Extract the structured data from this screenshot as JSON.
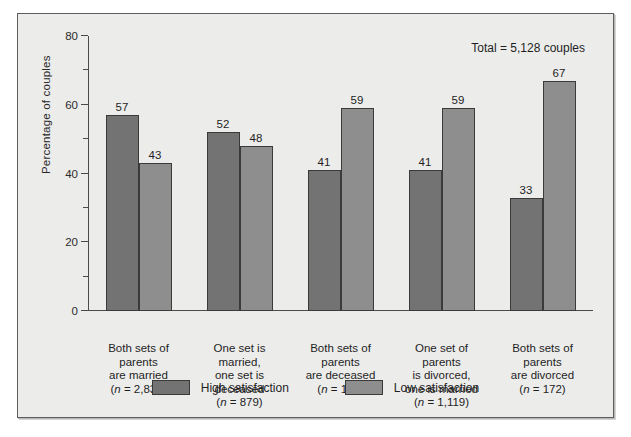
{
  "chart_data": {
    "type": "bar",
    "title": "",
    "xlabel": "",
    "ylabel": "Percentage of couples",
    "ylim": [
      0,
      80
    ],
    "yticks": [
      0,
      20,
      40,
      60,
      80
    ],
    "ytick_labels": [
      "0",
      "20",
      "40",
      "60",
      "80"
    ],
    "minor_ytick_step": 10,
    "grid": false,
    "legend_position": "bottom-center",
    "annotation": "Total = 5,128 couples",
    "categories": [
      "Both sets of parents are married (n = 2,831)",
      "One set is married, one set is deceased (n = 879)",
      "Both sets of parents are deceased (n = 127)",
      "One set of parents is divorced, one is married (n = 1,119)",
      "Both sets of parents are divorced (n = 172)"
    ],
    "category_lines": [
      [
        "Both sets of",
        "parents",
        "are married",
        "(n = 2,831)"
      ],
      [
        "One set is",
        "married,",
        "one set is",
        "deceased",
        "(n = 879)"
      ],
      [
        "Both sets of",
        "parents",
        "are deceased",
        "(n = 127)"
      ],
      [
        "One set of",
        "parents",
        "is divorced,",
        "one is married",
        "(n = 1,119)"
      ],
      [
        "Both sets of",
        "parents",
        "are divorced",
        "(n = 172)"
      ]
    ],
    "series": [
      {
        "name": "High satisfaction",
        "color": "#737373",
        "values": [
          57,
          52,
          41,
          41,
          33
        ]
      },
      {
        "name": "Low satisfaction",
        "color": "#8e8e8e",
        "values": [
          43,
          48,
          59,
          59,
          67
        ]
      }
    ]
  },
  "legend": {
    "items": [
      {
        "label": "High satisfaction",
        "color": "#737373"
      },
      {
        "label": "Low satisfaction",
        "color": "#8e8e8e"
      }
    ]
  },
  "axis": {
    "y_title": "Percentage of couples",
    "tick_labels": [
      "80",
      "60",
      "40",
      "20",
      "0"
    ]
  },
  "annotation": {
    "total": "Total = 5,128 couples"
  }
}
